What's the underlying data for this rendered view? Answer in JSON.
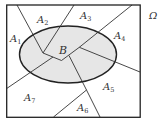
{
  "diagram": {
    "universe_label": "Ω",
    "event_label": "B",
    "partition_labels": [
      {
        "base": "A",
        "sub": "1"
      },
      {
        "base": "A",
        "sub": "2"
      },
      {
        "base": "A",
        "sub": "3"
      },
      {
        "base": "A",
        "sub": "4"
      },
      {
        "base": "A",
        "sub": "5"
      },
      {
        "base": "A",
        "sub": "6"
      },
      {
        "base": "A",
        "sub": "7"
      }
    ],
    "colors": {
      "stroke": "#2a2a2a",
      "ellipse_fill": "#e6e6e6",
      "background": "#ffffff"
    }
  }
}
